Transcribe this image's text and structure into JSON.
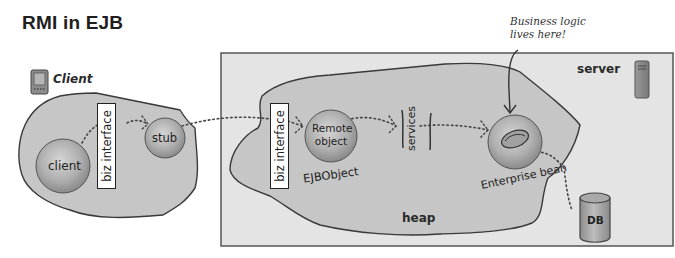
{
  "title": "RMI in EJB",
  "client_zone": {
    "label": "Client",
    "icon": "pda-device-icon",
    "nodes": [
      {
        "id": "client",
        "label": "client"
      },
      {
        "id": "stub",
        "label": "stub"
      }
    ],
    "interface_label": "biz interface"
  },
  "server_zone": {
    "label": "server",
    "icon": "server-tower-icon",
    "heap_label": "heap",
    "interface_label": "biz interface",
    "nodes": [
      {
        "id": "remote_object",
        "label_line1": "Remote",
        "label_line2": "object",
        "caption": "EJBObject"
      },
      {
        "id": "services",
        "label": "services"
      },
      {
        "id": "enterprise_bean",
        "caption": "Enterprise bean"
      }
    ],
    "database": {
      "label": "DB"
    }
  },
  "annotation": {
    "line1": "Business logic",
    "line2": "lives here!"
  },
  "colors": {
    "blob_fill": "#c9c9c9",
    "server_box_fill": "#e3e3e3",
    "node_fill": "#a8a8a8",
    "stroke": "#3a3a3a"
  }
}
